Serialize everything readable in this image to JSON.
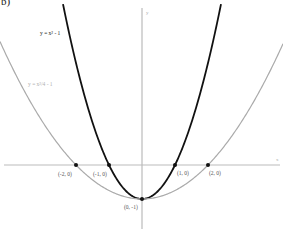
{
  "panel_label": "b)",
  "chart_data": {
    "type": "line",
    "title": "",
    "xlabel": "x",
    "ylabel": "y",
    "grid": false,
    "xlim": [
      -4.3,
      4.2
    ],
    "ylim": [
      -1.9,
      4.85
    ],
    "series": [
      {
        "name": "y = x² - 1",
        "function": "x^2 - 1",
        "color": "#111111",
        "label_pos": [
          40,
          35
        ],
        "label_color": "#222222"
      },
      {
        "name": "y = x²/4 - 1",
        "function": "x^2/4 - 1",
        "color": "#aaaaaa",
        "label_pos": [
          28,
          86
        ],
        "label_color": "#b0b0b0"
      }
    ],
    "points": [
      {
        "x": -2,
        "y": 0,
        "label": "(-2, 0)"
      },
      {
        "x": -1,
        "y": 0,
        "label": "(-1, 0)"
      },
      {
        "x": 1,
        "y": 0,
        "label": "(1, 0)"
      },
      {
        "x": 2,
        "y": 0,
        "label": "(2, 0)"
      },
      {
        "x": 0,
        "y": -1,
        "label": "(0, -1)"
      }
    ],
    "axis_color": "#bbbbbb"
  }
}
